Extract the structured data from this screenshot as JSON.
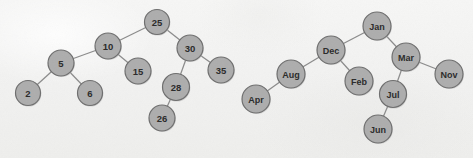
{
  "figure": {
    "background_color": "#f4f4f3",
    "node_fill": "#adadad",
    "node_stroke": "#6e6e6e",
    "edge_color": "#8b8b8b",
    "label_color": "#2a2a2a",
    "node_radius": 12.5,
    "label_font_size": 9.5
  },
  "trees": [
    {
      "name": "numeric-bst",
      "root": "25",
      "nodes": [
        {
          "id": "n25",
          "label": "25",
          "x": 157,
          "y": 22,
          "r": 12.5
        },
        {
          "id": "n10",
          "label": "10",
          "x": 108,
          "y": 46,
          "r": 13
        },
        {
          "id": "n30",
          "label": "30",
          "x": 190,
          "y": 48,
          "r": 13
        },
        {
          "id": "n5",
          "label": "5",
          "x": 61,
          "y": 63,
          "r": 13
        },
        {
          "id": "n15",
          "label": "15",
          "x": 138,
          "y": 71,
          "r": 13
        },
        {
          "id": "n28",
          "label": "28",
          "x": 176,
          "y": 87,
          "r": 13.5
        },
        {
          "id": "n35",
          "label": "35",
          "x": 221,
          "y": 70,
          "r": 13
        },
        {
          "id": "n2",
          "label": "2",
          "x": 28,
          "y": 93,
          "r": 12.5
        },
        {
          "id": "n6",
          "label": "6",
          "x": 90,
          "y": 93,
          "r": 12.5
        },
        {
          "id": "n26",
          "label": "26",
          "x": 162,
          "y": 118,
          "r": 13
        }
      ],
      "edges": [
        {
          "from": "n25",
          "to": "n10"
        },
        {
          "from": "n25",
          "to": "n30"
        },
        {
          "from": "n10",
          "to": "n5"
        },
        {
          "from": "n10",
          "to": "n15"
        },
        {
          "from": "n30",
          "to": "n28"
        },
        {
          "from": "n30",
          "to": "n35"
        },
        {
          "from": "n5",
          "to": "n2"
        },
        {
          "from": "n5",
          "to": "n6"
        },
        {
          "from": "n28",
          "to": "n26"
        }
      ]
    },
    {
      "name": "month-bst",
      "root": "Jan",
      "nodes": [
        {
          "id": "mJan",
          "label": "Jan",
          "x": 377,
          "y": 26,
          "r": 14
        },
        {
          "id": "mDec",
          "label": "Dec",
          "x": 331,
          "y": 50,
          "r": 14
        },
        {
          "id": "mMar",
          "label": "Mar",
          "x": 406,
          "y": 57,
          "r": 14
        },
        {
          "id": "mAug",
          "label": "Aug",
          "x": 291,
          "y": 74,
          "r": 14
        },
        {
          "id": "mFeb",
          "label": "Feb",
          "x": 359,
          "y": 81,
          "r": 14
        },
        {
          "id": "mJul",
          "label": "Jul",
          "x": 393,
          "y": 94,
          "r": 13.5
        },
        {
          "id": "mNov",
          "label": "Nov",
          "x": 449,
          "y": 74,
          "r": 14
        },
        {
          "id": "mApr",
          "label": "Apr",
          "x": 256,
          "y": 99,
          "r": 14
        },
        {
          "id": "mJun",
          "label": "Jun",
          "x": 378,
          "y": 129,
          "r": 14
        }
      ],
      "edges": [
        {
          "from": "mJan",
          "to": "mDec"
        },
        {
          "from": "mJan",
          "to": "mMar"
        },
        {
          "from": "mDec",
          "to": "mAug"
        },
        {
          "from": "mDec",
          "to": "mFeb"
        },
        {
          "from": "mMar",
          "to": "mJul"
        },
        {
          "from": "mMar",
          "to": "mNov"
        },
        {
          "from": "mAug",
          "to": "mApr"
        },
        {
          "from": "mJul",
          "to": "mJun"
        }
      ]
    }
  ]
}
